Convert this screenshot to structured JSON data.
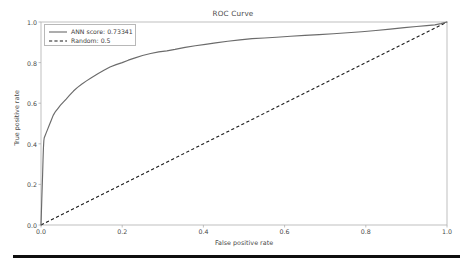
{
  "figure": {
    "title": "ROC Curve",
    "background_color": "#ffffff",
    "axes_color": "#b0b0b0"
  },
  "bottom_bar": {
    "name": "page-separator-bar",
    "color": "#0e0e0e"
  },
  "legend": {
    "position": "upper-left",
    "entries": [
      {
        "label": "ANN score: 0.73341",
        "style": "solid",
        "color": "#6b6b6b"
      },
      {
        "label": "Random: 0.5",
        "style": "dashed",
        "color": "#1a1a1a"
      }
    ]
  },
  "chart_data": {
    "type": "line",
    "title": "ROC Curve",
    "xlabel": "False positive rate",
    "ylabel": "True positive rate",
    "xlim": [
      0.0,
      1.0
    ],
    "ylim": [
      0.0,
      1.0
    ],
    "xticks": [
      "0.0",
      "0.2",
      "0.4",
      "0.6",
      "0.8",
      "1.0"
    ],
    "xtick_values": [
      0.0,
      0.2,
      0.4,
      0.6,
      0.8,
      1.0
    ],
    "yticks": [
      "0.0",
      "0.2",
      "0.4",
      "0.6",
      "0.8",
      "1.0"
    ],
    "ytick_values": [
      0.0,
      0.2,
      0.4,
      0.6,
      0.8,
      1.0
    ],
    "grid": false,
    "legend_position": "upper left",
    "series": [
      {
        "name": "ANN score: 0.73341",
        "auc": 0.73341,
        "style": "solid",
        "color": "#6b6b6b",
        "x": [
          0.0,
          0.002,
          0.004,
          0.005,
          0.006,
          0.007,
          0.008,
          0.01,
          0.013,
          0.016,
          0.02,
          0.025,
          0.03,
          0.036,
          0.042,
          0.048,
          0.055,
          0.062,
          0.07,
          0.08,
          0.09,
          0.1,
          0.112,
          0.125,
          0.14,
          0.155,
          0.17,
          0.185,
          0.2,
          0.215,
          0.23,
          0.25,
          0.27,
          0.29,
          0.31,
          0.33,
          0.355,
          0.38,
          0.405,
          0.43,
          0.46,
          0.49,
          0.52,
          0.55,
          0.58,
          0.615,
          0.65,
          0.685,
          0.72,
          0.755,
          0.79,
          0.825,
          0.86,
          0.895,
          0.925,
          0.95,
          0.97,
          0.985,
          1.0
        ],
        "y": [
          0.0,
          0.13,
          0.25,
          0.32,
          0.38,
          0.415,
          0.43,
          0.44,
          0.455,
          0.47,
          0.49,
          0.515,
          0.54,
          0.56,
          0.575,
          0.59,
          0.605,
          0.62,
          0.638,
          0.66,
          0.678,
          0.693,
          0.71,
          0.727,
          0.745,
          0.762,
          0.778,
          0.79,
          0.8,
          0.812,
          0.822,
          0.835,
          0.845,
          0.853,
          0.858,
          0.865,
          0.875,
          0.883,
          0.89,
          0.897,
          0.905,
          0.912,
          0.918,
          0.921,
          0.925,
          0.93,
          0.934,
          0.938,
          0.942,
          0.947,
          0.952,
          0.958,
          0.965,
          0.972,
          0.978,
          0.982,
          0.986,
          0.992,
          1.0
        ]
      },
      {
        "name": "Random: 0.5",
        "auc": 0.5,
        "style": "dashed",
        "color": "#1a1a1a",
        "x": [
          0.0,
          1.0
        ],
        "y": [
          0.0,
          1.0
        ]
      }
    ]
  }
}
